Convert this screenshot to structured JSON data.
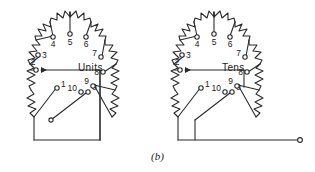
{
  "figure": {
    "caption": "(b)",
    "kind": "schematic-diagram"
  },
  "dials": [
    {
      "id": "units",
      "label": "Units",
      "label_x": 78,
      "label_y": 68,
      "cx": 68,
      "cy": 95,
      "terminals": [
        {
          "n": "0",
          "tx": 88,
          "ty": 92,
          "lx": 92,
          "ly": 90,
          "anchor": "start"
        },
        {
          "n": "1",
          "tx": 57,
          "ty": 88,
          "lx": 61,
          "ly": 87,
          "anchor": "start"
        },
        {
          "n": "2",
          "tx": 36,
          "ty": 70,
          "lx": 33,
          "ly": 65,
          "anchor": "middle"
        },
        {
          "n": "3",
          "tx": 38,
          "ty": 55,
          "lx": 42,
          "ly": 57,
          "anchor": "start"
        },
        {
          "n": "4",
          "tx": 53,
          "ty": 37,
          "lx": 53,
          "ly": 47,
          "anchor": "middle"
        },
        {
          "n": "5",
          "tx": 70,
          "ty": 34,
          "lx": 70,
          "ly": 45,
          "anchor": "middle"
        },
        {
          "n": "6",
          "tx": 86,
          "ty": 37,
          "lx": 86,
          "ly": 47,
          "anchor": "middle"
        },
        {
          "n": "7",
          "tx": 101,
          "ty": 57,
          "lx": 97,
          "ly": 57,
          "anchor": "end"
        },
        {
          "n": "8",
          "tx": 103,
          "ty": 72,
          "lx": 99,
          "ly": 74,
          "anchor": "end"
        },
        {
          "n": "9",
          "tx": 93,
          "ty": 86,
          "lx": 89,
          "ly": 85,
          "anchor": "end"
        },
        {
          "n": "10",
          "tx": 81,
          "ty": 92,
          "lx": 77,
          "ly": 91,
          "anchor": "end"
        }
      ],
      "wiper": {
        "from_x": 51,
        "from_y": 120,
        "to_x": 86,
        "to_y": 93
      }
    },
    {
      "id": "tens",
      "label": "Tens",
      "label_x": 222,
      "label_y": 68,
      "cx": 212,
      "cy": 95,
      "terminals": [
        {
          "n": "0",
          "tx": 232,
          "ty": 92,
          "lx": 236,
          "ly": 90,
          "anchor": "start"
        },
        {
          "n": "1",
          "tx": 201,
          "ty": 88,
          "lx": 205,
          "ly": 87,
          "anchor": "start"
        },
        {
          "n": "2",
          "tx": 180,
          "ty": 70,
          "lx": 177,
          "ly": 65,
          "anchor": "middle"
        },
        {
          "n": "3",
          "tx": 182,
          "ty": 55,
          "lx": 186,
          "ly": 57,
          "anchor": "start"
        },
        {
          "n": "4",
          "tx": 197,
          "ty": 37,
          "lx": 197,
          "ly": 47,
          "anchor": "middle"
        },
        {
          "n": "5",
          "tx": 214,
          "ty": 34,
          "lx": 214,
          "ly": 45,
          "anchor": "middle"
        },
        {
          "n": "6",
          "tx": 230,
          "ty": 37,
          "lx": 230,
          "ly": 47,
          "anchor": "middle"
        },
        {
          "n": "7",
          "tx": 245,
          "ty": 57,
          "lx": 241,
          "ly": 57,
          "anchor": "end"
        },
        {
          "n": "8",
          "tx": 247,
          "ty": 72,
          "lx": 243,
          "ly": 74,
          "anchor": "end"
        },
        {
          "n": "9",
          "tx": 237,
          "ty": 86,
          "lx": 233,
          "ly": 85,
          "anchor": "end"
        },
        {
          "n": "10",
          "tx": 225,
          "ty": 92,
          "lx": 221,
          "ly": 91,
          "anchor": "end"
        }
      ],
      "wiper": {
        "from_x": 195,
        "from_y": 120,
        "to_x": 230,
        "to_y": 93
      }
    }
  ],
  "style": {
    "line_color": "#2b2b2b",
    "text_color": "#1a1a1a",
    "background": "#ffffff",
    "stroke_width": 1.1
  }
}
